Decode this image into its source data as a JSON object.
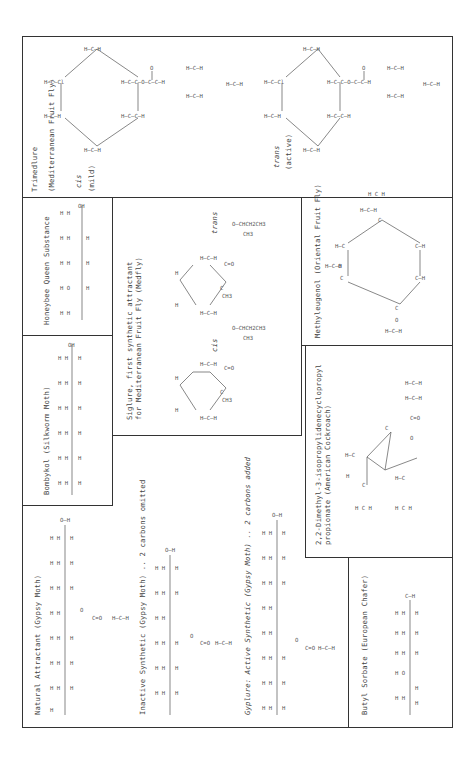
{
  "document": {
    "orientation": "rotated-90-ccw",
    "title": "Insect attractants structural formulas"
  },
  "panels": {
    "trimedlure": {
      "title": "Trimedlure",
      "subtitle": "(Mediterranean Fruit Fly)",
      "isomers": [
        {
          "label": "cis",
          "note": "(mild)"
        },
        {
          "label": "trans",
          "note": "(active)"
        }
      ]
    },
    "honeybee": {
      "title": "Honeybee  Queen  Substance",
      "formula_rows": [
        "H H H H H H H H H O",
        "H-C-C-C-C-C-C-C=C-C=C-OH",
        "H   H H H H H H"
      ]
    },
    "bombykol": {
      "title": "Bombykol  (Silkworm Moth)",
      "formula_rows": [
        "H H H H H H H H H H H H H H H H",
        "H-C-C-C-C-C=C-C=C-C-C-C-C-C-C-C-C-OH",
        "H H H H     H H H H H H H H H H H"
      ]
    },
    "siglure": {
      "title": "Siglure, first synthetic attractant",
      "subtitle": "for Mediterranean Fruit Fly (Medfly)",
      "isomers": [
        {
          "label": "cis"
        },
        {
          "label": "trans"
        }
      ],
      "ester_group": "O-CHCH2CH3",
      "methyl": "CH3"
    },
    "methyleugenol": {
      "title": "Methyleugenol  (Oriental Fruit Fly)"
    },
    "dimethyl": {
      "title": "2,2-Dimethyl-3-isopropylidenecyclopropyl",
      "subtitle": "propionate  (American Cockroach)"
    },
    "natural_attractant": {
      "title": "Natural Attractant  (Gypsy Moth)"
    },
    "inactive_synthetic": {
      "title": "Inactive Synthetic  (Gypsy Moth) .. 2 carbons omitted"
    },
    "gyplure": {
      "title": "Gyplure: Active Synthetic  (Gypsy Moth) .. 2 carbons added"
    },
    "butyl_sorbate": {
      "title": "Butyl Sorbate  (European Chafer)"
    }
  },
  "atoms": {
    "H": "H",
    "C": "C",
    "O": "O",
    "Cl": "Cl",
    "OH": "OH",
    "CH3": "CH3"
  }
}
